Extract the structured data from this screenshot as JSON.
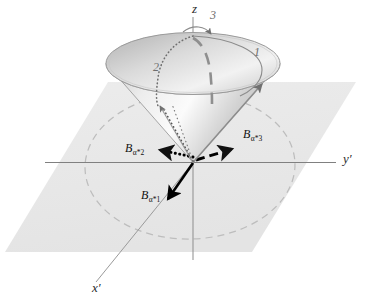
{
  "figure": {
    "type": "3d-geometry-diagram",
    "background_color": "#ffffff",
    "plane_color": "#e9e9e9",
    "cone_color": "#d9d9d9",
    "axis_color": "#6e6e6e",
    "vector_color": "#000000",
    "arc_color": "#7b7b7b",
    "dashed_circle_color": "#b9b9b9"
  },
  "axes": [
    {
      "id": "z",
      "label": "z",
      "prime": ""
    },
    {
      "id": "yp",
      "label": "y",
      "prime": "′"
    },
    {
      "id": "xp",
      "label": "x",
      "prime": "′"
    }
  ],
  "axis_labels": {
    "z": "z",
    "y_prime": "y′",
    "x_prime": "x′"
  },
  "cone_arc_labels": [
    {
      "id": "arc-1",
      "label": "1"
    },
    {
      "id": "arc-2",
      "label": "2"
    },
    {
      "id": "arc-3",
      "label": "3"
    }
  ],
  "vectors": [
    {
      "id": "B-alpha-1",
      "base": "B",
      "subscript": "α*1",
      "style": "solid",
      "direction": "down-left",
      "color": "#000000"
    },
    {
      "id": "B-alpha-2",
      "base": "B",
      "subscript": "α*2",
      "style": "dotted",
      "direction": "left",
      "color": "#000000"
    },
    {
      "id": "B-alpha-3",
      "base": "B",
      "subscript": "α*3",
      "style": "dashed",
      "direction": "right",
      "color": "#000000"
    }
  ]
}
